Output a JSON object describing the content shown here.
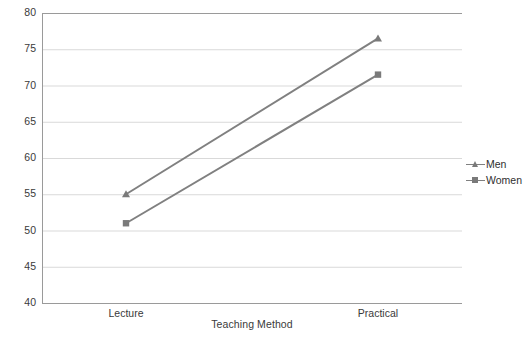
{
  "chart_data": {
    "type": "line",
    "title": "",
    "xlabel": "Teaching Method",
    "ylabel": "Cource Final Mark",
    "categories": [
      "Lecture",
      "Practical"
    ],
    "series": [
      {
        "name": "Men",
        "values": [
          55,
          76.5
        ],
        "color": "#808080",
        "marker": "triangle"
      },
      {
        "name": "Women",
        "values": [
          51,
          71.5
        ],
        "color": "#808080",
        "marker": "square"
      }
    ],
    "ylim": [
      40,
      80
    ],
    "yticks": [
      40,
      45,
      50,
      55,
      60,
      65,
      70,
      75,
      80
    ],
    "ytick_labels": [
      "40",
      "45",
      "50",
      "55",
      "60",
      "65",
      "70",
      "75",
      "80"
    ],
    "xtick_labels": [
      "Lecture",
      "Practical"
    ],
    "grid": "horizontal",
    "legend_position": "right",
    "legend_entries": [
      "Men",
      "Women"
    ]
  },
  "axes": {
    "y_title": "Cource Final Mark",
    "x_title": "Teaching Method"
  },
  "legend": {
    "items": [
      {
        "label": "Men"
      },
      {
        "label": "Women"
      }
    ]
  },
  "colors": {
    "line": "#808080",
    "marker": "#7a7a7a",
    "grid": "#d9d9d9",
    "axis": "#9a9a9a",
    "text": "#3a3a3a",
    "background": "#ffffff"
  }
}
